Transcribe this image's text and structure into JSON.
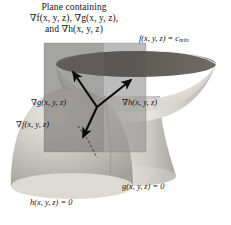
{
  "figure": {
    "title_lines": [
      "Plane containing",
      "∇f(x, y, z), ∇g(x, y, z),",
      "and ∇h(x, y, z)"
    ],
    "background_color": "#ffffff",
    "ink_color": "#141414"
  },
  "labels": {
    "level_surface_f": "f(x, y, z) = c",
    "level_surface_f_subscript": "min",
    "constraint_g": "g(x, y, z) = 0",
    "constraint_h": "h(x, y, z) = 0",
    "gradient_f": "∇f(x, y, z)",
    "gradient_g": "∇g(x, y, z)",
    "gradient_h": "∇h(x, y, z)"
  },
  "geometry": {
    "plane_rect": {
      "x": 44,
      "y": 43,
      "width": 102,
      "height": 109,
      "fill": "#8f8f8f",
      "opacity": 0.62
    },
    "bowl": {
      "rim_center_x": 136,
      "rim_center_y": 64,
      "rim_rx": 80,
      "rim_ry": 13,
      "fill_light": "#d8d5cf",
      "interior_dark": "#55524e"
    },
    "dome": {
      "center_x": 72,
      "center_y": 150,
      "rx": 62,
      "ry": 72,
      "fill": "#c9c6c0"
    },
    "vector_origin": {
      "x": 97,
      "y": 107
    },
    "vectors": [
      {
        "name": "gradient-g",
        "to_x": 72,
        "to_y": 72
      },
      {
        "name": "gradient-h",
        "to_x": 131,
        "to_y": 80
      },
      {
        "name": "gradient-f",
        "to_x": 82,
        "to_y": 137
      }
    ],
    "leader_line": {
      "from_x": 78,
      "from_y": 126,
      "to_x": 99,
      "to_y": 157
    },
    "arrow_color": "#0c0c0c"
  }
}
